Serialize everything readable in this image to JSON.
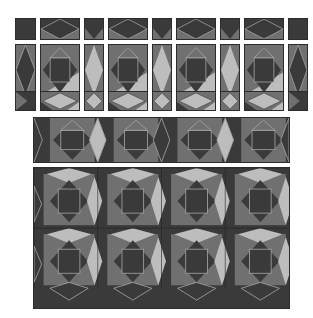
{
  "palette": {
    "dark": "#3a3a3a",
    "medium": "#707070",
    "light": "#bdbdbd",
    "line": "#a9a9a9",
    "background": "#ffffff"
  },
  "layout": {
    "columns": [
      {
        "x": 15,
        "w": 21,
        "kind": "narrow"
      },
      {
        "x": 40,
        "w": 40,
        "kind": "wide"
      },
      {
        "x": 84,
        "w": 20,
        "kind": "narrow"
      },
      {
        "x": 108,
        "w": 40,
        "kind": "wide"
      },
      {
        "x": 152,
        "w": 20,
        "kind": "narrow"
      },
      {
        "x": 176,
        "w": 40,
        "kind": "wide"
      },
      {
        "x": 220,
        "w": 20,
        "kind": "narrow"
      },
      {
        "x": 244,
        "w": 40,
        "kind": "wide"
      },
      {
        "x": 288,
        "w": 20,
        "kind": "narrow"
      }
    ],
    "rows": [
      {
        "name": "row-a",
        "y": 18,
        "h": 22
      },
      {
        "name": "row-b",
        "y": 44,
        "h": 52
      },
      {
        "name": "row-c",
        "y": 91,
        "h": 20
      }
    ],
    "band1": {
      "x": 33,
      "y": 117,
      "w": 257,
      "h": 46
    },
    "band2": {
      "x": 33,
      "y": 167,
      "w": 257,
      "h": 142
    }
  },
  "sections": [
    {
      "name": "tile-row-a",
      "description": "Top row of separated tiles: dark squares and dark diamond lozenges"
    },
    {
      "name": "tile-row-b",
      "description": "Middle row: square-in-diamond tiles alternating with vertical lozenges"
    },
    {
      "name": "tile-row-c",
      "description": "Bottom row: light diamonds and light lozenges"
    },
    {
      "name": "assembled-band-strip",
      "description": "Assembled strip of the tiles"
    },
    {
      "name": "assembled-panel",
      "description": "Full assembled tessellation panel"
    }
  ]
}
